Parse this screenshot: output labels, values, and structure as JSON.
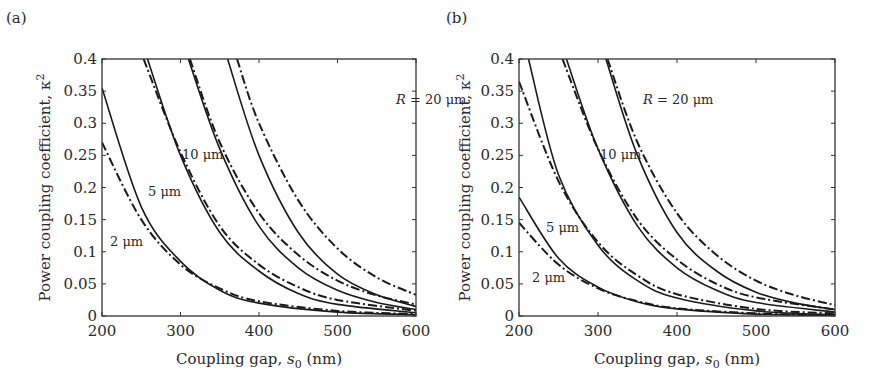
{
  "chart_data": [
    {
      "panel": "(a)",
      "type": "line",
      "title": "",
      "xlabel": "Coupling gap, s0 (nm)",
      "ylabel": "Power coupling coefficient, κ²",
      "xlim": [
        200,
        600
      ],
      "ylim": [
        0,
        0.4
      ],
      "xticks": [
        "200",
        "300",
        "400",
        "500",
        "600"
      ],
      "yticks": [
        "0",
        "0.05",
        "0.1",
        "0.15",
        "0.2",
        "0.25",
        "0.3",
        "0.35",
        "0.4"
      ],
      "grid": false,
      "line_styles": {
        "solid": "model A",
        "dash-dot": "model B"
      },
      "annotations": [
        "R = 20 μm",
        "10 μm",
        "5 μm",
        "2 μm"
      ],
      "series": [
        {
          "name": "2 μm solid",
          "style": "solid",
          "x": [
            200,
            250,
            300,
            350,
            400,
            500,
            600
          ],
          "y": [
            0.355,
            0.17,
            0.085,
            0.04,
            0.02,
            0.006,
            0.002
          ]
        },
        {
          "name": "2 μm dash-dot",
          "style": "dashdot",
          "x": [
            200,
            250,
            300,
            350,
            400,
            500,
            600
          ],
          "y": [
            0.27,
            0.15,
            0.08,
            0.043,
            0.023,
            0.008,
            0.003
          ]
        },
        {
          "name": "5 μm solid",
          "style": "solid",
          "x": [
            258,
            300,
            350,
            400,
            450,
            500,
            600
          ],
          "y": [
            0.4,
            0.25,
            0.13,
            0.07,
            0.035,
            0.018,
            0.005
          ]
        },
        {
          "name": "5 μm dash-dot",
          "style": "dashdot",
          "x": [
            253,
            300,
            350,
            400,
            450,
            500,
            600
          ],
          "y": [
            0.4,
            0.255,
            0.14,
            0.08,
            0.045,
            0.025,
            0.008
          ]
        },
        {
          "name": "10 μm solid",
          "style": "solid",
          "x": [
            310,
            350,
            400,
            450,
            500,
            550,
            600
          ],
          "y": [
            0.4,
            0.26,
            0.14,
            0.075,
            0.04,
            0.021,
            0.01
          ]
        },
        {
          "name": "10 μm dash-dot",
          "style": "dashdot",
          "x": [
            312,
            350,
            400,
            450,
            500,
            550,
            600
          ],
          "y": [
            0.4,
            0.27,
            0.16,
            0.095,
            0.055,
            0.032,
            0.018
          ]
        },
        {
          "name": "20 μm solid",
          "style": "solid",
          "x": [
            360,
            400,
            450,
            500,
            550,
            600
          ],
          "y": [
            0.4,
            0.25,
            0.13,
            0.065,
            0.033,
            0.015
          ]
        },
        {
          "name": "20 μm dash-dot",
          "style": "dashdot",
          "x": [
            372,
            400,
            450,
            500,
            550,
            600
          ],
          "y": [
            0.4,
            0.3,
            0.18,
            0.105,
            0.06,
            0.033
          ]
        }
      ]
    },
    {
      "panel": "(b)",
      "type": "line",
      "title": "",
      "xlabel": "Coupling gap, s0 (nm)",
      "ylabel": "Power coupling coefficient, κ²",
      "xlim": [
        200,
        600
      ],
      "ylim": [
        0,
        0.4
      ],
      "xticks": [
        "200",
        "300",
        "400",
        "500",
        "600"
      ],
      "yticks": [
        "0",
        "0.05",
        "0.1",
        "0.15",
        "0.2",
        "0.25",
        "0.3",
        "0.35",
        "0.4"
      ],
      "grid": false,
      "annotations": [
        "R = 20 μm",
        "10 μm",
        "5 μm",
        "2 μm"
      ],
      "series": [
        {
          "name": "2 μm solid",
          "style": "solid",
          "x": [
            200,
            250,
            300,
            350,
            400,
            500,
            600
          ],
          "y": [
            0.185,
            0.09,
            0.045,
            0.022,
            0.011,
            0.003,
            0.001
          ]
        },
        {
          "name": "2 μm dash-dot",
          "style": "dashdot",
          "x": [
            200,
            250,
            300,
            350,
            400,
            500,
            600
          ],
          "y": [
            0.145,
            0.08,
            0.043,
            0.023,
            0.012,
            0.004,
            0.001
          ]
        },
        {
          "name": "5 μm solid",
          "style": "solid",
          "x": [
            212,
            250,
            300,
            350,
            400,
            500,
            600
          ],
          "y": [
            0.4,
            0.22,
            0.11,
            0.055,
            0.028,
            0.008,
            0.002
          ]
        },
        {
          "name": "5 μm dash-dot",
          "style": "dashdot",
          "x": [
            200,
            250,
            300,
            350,
            400,
            500,
            600
          ],
          "y": [
            0.365,
            0.21,
            0.115,
            0.063,
            0.034,
            0.011,
            0.004
          ]
        },
        {
          "name": "10 μm solid",
          "style": "solid",
          "x": [
            260,
            300,
            350,
            400,
            450,
            500,
            600
          ],
          "y": [
            0.4,
            0.26,
            0.14,
            0.075,
            0.04,
            0.021,
            0.006
          ]
        },
        {
          "name": "10 μm dash-dot",
          "style": "dashdot",
          "x": [
            255,
            300,
            350,
            400,
            450,
            500,
            600
          ],
          "y": [
            0.4,
            0.26,
            0.15,
            0.088,
            0.05,
            0.029,
            0.01
          ]
        },
        {
          "name": "20 μm solid",
          "style": "solid",
          "x": [
            310,
            350,
            400,
            450,
            500,
            550,
            600
          ],
          "y": [
            0.4,
            0.25,
            0.13,
            0.07,
            0.037,
            0.02,
            0.01
          ]
        },
        {
          "name": "20 μm dash-dot",
          "style": "dashdot",
          "x": [
            312,
            350,
            400,
            450,
            500,
            550,
            600
          ],
          "y": [
            0.4,
            0.27,
            0.16,
            0.095,
            0.055,
            0.032,
            0.017
          ]
        }
      ]
    }
  ],
  "labels": {
    "panel_a": "(a)",
    "panel_b": "(b)",
    "ylabel_main": "Power coupling coefficient, κ",
    "ylabel_sup": "2",
    "xlabel_main": "Coupling gap, ",
    "xlabel_var": "s",
    "xlabel_sub": "0",
    "xlabel_unit": " (nm)",
    "r20_var": "R",
    "r20_rest": " = 20 μm",
    "r10": "10 μm",
    "r5": "5 μm",
    "r2": "2 μm"
  }
}
